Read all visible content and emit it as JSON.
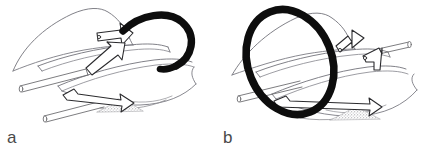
{
  "figure": {
    "caption_panels": [
      {
        "id": "a",
        "label": "a"
      },
      {
        "id": "b",
        "label": "b"
      }
    ],
    "colors": {
      "background": "#ffffff",
      "outline": "#6e6e72",
      "outline_light": "#8d8d92",
      "device_black": "#0d0d0d",
      "shading_stipple": "#9a9a9e",
      "label_text": "#4a4a4a"
    },
    "panel_a": {
      "label": "a",
      "device_shape": "u-hook",
      "elements": [
        "curved-leaflet-sheet-upper",
        "curved-leaflet-sheet-middle",
        "curved-leaflet-sheet-lower",
        "catheter-rod-upper-left",
        "catheter-rod-lower-left",
        "clip-arrow-upper",
        "clip-arrow-lower",
        "stipple-shading-patch",
        "black-tube-u-hook"
      ]
    },
    "panel_b": {
      "label": "b",
      "device_shape": "closed-ring",
      "elements": [
        "curved-leaflet-sheet-upper",
        "curved-leaflet-sheet-middle",
        "curved-leaflet-sheet-lower",
        "catheter-rod-left",
        "catheter-rod-right",
        "clip-arrow-upper",
        "clip-arrow-middle",
        "clip-arrow-lower",
        "stipple-shading-patch",
        "black-tube-ring"
      ]
    }
  }
}
